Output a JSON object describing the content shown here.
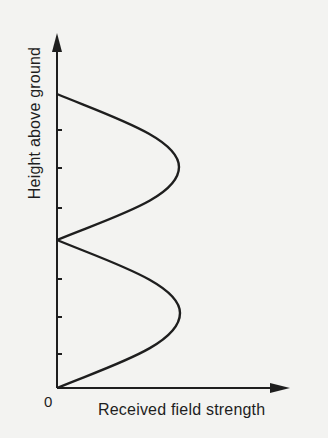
{
  "diagram": {
    "type": "field-strength-height-profile",
    "y_axis_label": "Height above ground",
    "x_axis_label": "Received field strength",
    "origin_label": "0",
    "colors": {
      "background": "#f3f3f1",
      "ink": "#1e1e1e"
    },
    "geometry": {
      "origin": [
        57,
        388
      ],
      "y_axis_top": [
        57,
        33
      ],
      "x_axis_end": [
        290,
        388
      ],
      "nulls_y": [
        388,
        240,
        94
      ],
      "lobe_peaks": [
        [
          180,
          313
        ],
        [
          179,
          167
        ]
      ],
      "y_ticks": [
        354,
        317,
        279,
        208,
        168,
        130
      ]
    },
    "lobes": [
      {
        "name": "lower-lobe",
        "from_y": 388,
        "to_y": 240,
        "peak_x": 180,
        "peak_y": 313
      },
      {
        "name": "upper-lobe",
        "from_y": 240,
        "to_y": 94,
        "peak_x": 179,
        "peak_y": 167
      }
    ]
  }
}
